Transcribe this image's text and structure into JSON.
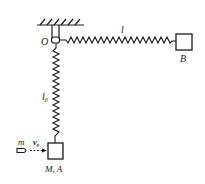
{
  "diagram": {
    "labels": {
      "pivot": "O",
      "spring_horizontal": "l",
      "box_b": "B",
      "spring_vertical": "l",
      "spring_vertical_sub": "0",
      "bullet_mass": "m",
      "bullet_velocity": "v",
      "bullet_velocity_sub": "0",
      "box_a": "M, A"
    },
    "colors": {
      "stroke": "#1a1a1a",
      "background": "#ffffff"
    }
  }
}
